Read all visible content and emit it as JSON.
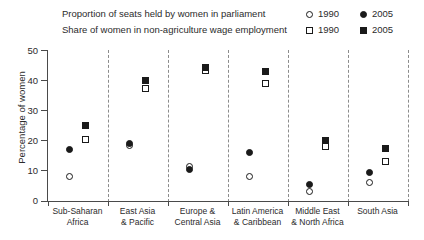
{
  "legend": {
    "rows": [
      {
        "text": "Proportion of seats held by women in parliament",
        "marker": "circle",
        "keys": [
          {
            "year": "1990",
            "style": "open"
          },
          {
            "year": "2005",
            "style": "filled"
          }
        ]
      },
      {
        "text": "Share of women in non-agriculture wage employment",
        "marker": "square",
        "keys": [
          {
            "year": "1990",
            "style": "open"
          },
          {
            "year": "2005",
            "style": "filled"
          }
        ]
      }
    ]
  },
  "axis": {
    "ylabel": "Percentage of women",
    "yticks": [
      "0",
      "10",
      "20",
      "30",
      "40",
      "50"
    ]
  },
  "categories": [
    {
      "line1": "Sub-Saharan",
      "line2": "Africa"
    },
    {
      "line1": "East Asia",
      "line2": "& Pacific"
    },
    {
      "line1": "Europe &",
      "line2": "Central Asia"
    },
    {
      "line1": "Latin America",
      "line2": "& Caribbean"
    },
    {
      "line1": "Middle East",
      "line2": "& North Africa"
    },
    {
      "line1": "South Asia",
      "line2": ""
    }
  ],
  "chart_data": {
    "type": "scatter",
    "title": "",
    "xlabel": "",
    "ylabel": "Percentage of women",
    "ylim": [
      0,
      50
    ],
    "ytick_values": [
      0,
      10,
      20,
      30,
      40,
      50
    ],
    "grid": false,
    "legend_position": "top-right",
    "categories": [
      "Sub-Saharan Africa",
      "East Asia & Pacific",
      "Europe & Central Asia",
      "Latin America & Caribbean",
      "Middle East & North Africa",
      "South Asia"
    ],
    "series": [
      {
        "name": "Proportion of seats held by women in parliament, 1990",
        "marker": "open-circle",
        "values": [
          8,
          18.5,
          11.5,
          8,
          3,
          6
        ]
      },
      {
        "name": "Proportion of seats held by women in parliament, 2005",
        "marker": "filled-circle",
        "values": [
          17,
          19,
          10.5,
          16,
          5.5,
          9.5
        ]
      },
      {
        "name": "Share of women in non-agriculture wage employment, 1990",
        "marker": "open-square",
        "values": [
          20.5,
          37.5,
          43.5,
          39,
          18,
          13
        ]
      },
      {
        "name": "Share of women in non-agriculture wage employment, 2005",
        "marker": "filled-square",
        "values": [
          25,
          40,
          44.5,
          43,
          20,
          17.5
        ]
      }
    ]
  }
}
